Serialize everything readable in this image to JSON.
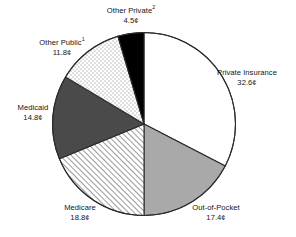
{
  "chart_data": {
    "type": "pie",
    "title": "",
    "subtitle": "",
    "xlabel": "",
    "ylabel": "",
    "legend_position": "none",
    "grid": false,
    "units": "cents",
    "start_angle_deg": 0,
    "direction": "clockwise",
    "categories": [
      "Private Insurance",
      "Out-of-Pocket",
      "Medicare",
      "Medicaid",
      "Other Public",
      "Other Private"
    ],
    "values": [
      32.6,
      17.4,
      18.8,
      14.8,
      11.8,
      4.5
    ],
    "value_labels": [
      "32.6¢",
      "17.4¢",
      "18.8¢",
      "14.8¢",
      "11.8¢",
      "4.5¢"
    ],
    "slices": [
      {
        "name": "Private Insurance",
        "value": 32.6,
        "value_label": "32.6¢",
        "footnote": "",
        "fill": "#ffffff",
        "pattern": "solid",
        "start_deg": 0.0,
        "end_deg": 117.36
      },
      {
        "name": "Out-of-Pocket",
        "value": 17.4,
        "value_label": "17.4¢",
        "footnote": "",
        "fill": "#a9a9a9",
        "pattern": "solid",
        "start_deg": 117.36,
        "end_deg": 180.0
      },
      {
        "name": "Medicare",
        "value": 18.8,
        "value_label": "18.8¢",
        "footnote": "",
        "fill": "#ffffff",
        "pattern": "diagonal-hatch",
        "start_deg": 180.0,
        "end_deg": 247.68
      },
      {
        "name": "Medicaid",
        "value": 14.8,
        "value_label": "14.8¢",
        "footnote": "",
        "fill": "#4a4a4a",
        "pattern": "solid",
        "start_deg": 247.68,
        "end_deg": 300.96
      },
      {
        "name": "Other Public",
        "value": 11.8,
        "value_label": "11.8¢",
        "footnote": "1",
        "fill": "#fbfbfb",
        "pattern": "stipple",
        "start_deg": 300.96,
        "end_deg": 343.44
      },
      {
        "name": "Other Private",
        "value": 4.5,
        "value_label": "4.5¢",
        "footnote": "2",
        "fill": "#000000",
        "pattern": "solid",
        "start_deg": 343.44,
        "end_deg": 360.0
      }
    ]
  },
  "labels": {
    "other_private": {
      "name": "Other Private",
      "footnote": "2",
      "value": "4.5¢"
    },
    "other_public": {
      "name": "Other Public",
      "footnote": "1",
      "value": "11.8¢"
    },
    "medicaid": {
      "name": "Medicaid",
      "footnote": "",
      "value": "14.8¢"
    },
    "medicare": {
      "name": "Medicare",
      "footnote": "",
      "value": "18.8¢"
    },
    "out_of_pocket": {
      "name": "Out-of-Pocket",
      "footnote": "",
      "value": "17.4¢"
    },
    "private_insurance": {
      "name": "Private Insurance",
      "footnote": "",
      "value": "32.6¢"
    }
  },
  "colors": {
    "outline": "#2b2b2b",
    "private_insurance": "#ffffff",
    "out_of_pocket": "#a9a9a9",
    "medicare": "#ffffff",
    "medicaid": "#4a4a4a",
    "other_public": "#fbfbfb",
    "other_private": "#000000",
    "text": "#141414"
  }
}
